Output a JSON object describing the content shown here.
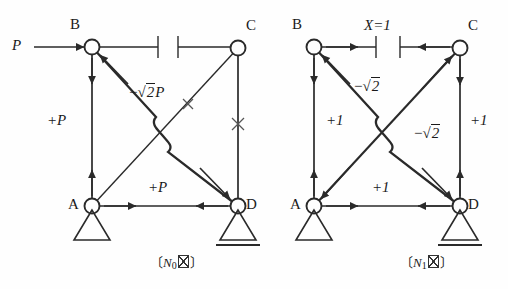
{
  "figure": {
    "type": "truss-force-diagram-pair"
  },
  "panels": [
    {
      "id": "N0",
      "caption_prefix": "〔",
      "caption_symbol": "N",
      "caption_sub": "0",
      "caption_kanji": "図",
      "caption_suffix": "〕",
      "caption_plain": "〔N0図〕",
      "nodes": [
        {
          "id": "B",
          "label": "B",
          "x": 92,
          "y": 47,
          "label_dx": -22,
          "label_dy": -30
        },
        {
          "id": "C",
          "label": "C",
          "x": 238,
          "y": 48,
          "label_dx": 8,
          "label_dy": -30
        },
        {
          "id": "A",
          "label": "A",
          "x": 92,
          "y": 206,
          "label_dx": -24,
          "label_dy": -9
        },
        {
          "id": "D",
          "label": "D",
          "x": 238,
          "y": 206,
          "label_dx": 8,
          "label_dy": -9
        }
      ],
      "external_load": {
        "label": "P",
        "applied_at": "B",
        "direction": "right"
      },
      "members": [
        {
          "name": "top-chord-BC",
          "from": "B",
          "to": "C",
          "force": "",
          "state": "cut-released"
        },
        {
          "name": "left-chord-AB",
          "from": "A",
          "to": "B",
          "force": "+P",
          "state": "tension"
        },
        {
          "name": "right-chord-CD",
          "from": "C",
          "to": "D",
          "force": "",
          "state": "zero-force"
        },
        {
          "name": "bottom-chord-AD",
          "from": "A",
          "to": "D",
          "force": "+P",
          "state": "tension"
        },
        {
          "name": "diagonal-BD",
          "from": "B",
          "to": "D",
          "force": "-√2 P",
          "state": "compression"
        },
        {
          "name": "diagonal-AC",
          "from": "A",
          "to": "C",
          "force": "",
          "state": "zero-force"
        }
      ],
      "labels": {
        "load": "P",
        "left_chord": "+P",
        "bottom_chord": "+P",
        "diagonal_minus": "P"
      },
      "supports": [
        {
          "node": "A",
          "type": "pin"
        },
        {
          "node": "D",
          "type": "roller"
        }
      ]
    },
    {
      "id": "N1",
      "caption_prefix": "〔",
      "caption_symbol": "N",
      "caption_sub": "1",
      "caption_kanji": "図",
      "caption_suffix": "〕",
      "caption_plain": "〔N1図〕",
      "nodes": [
        {
          "id": "B",
          "label": "B",
          "x": 60,
          "y": 47,
          "label_dx": -22,
          "label_dy": -30
        },
        {
          "id": "C",
          "label": "C",
          "x": 206,
          "y": 48,
          "label_dx": 8,
          "label_dy": -30
        },
        {
          "id": "A",
          "label": "A",
          "x": 60,
          "y": 206,
          "label_dx": -24,
          "label_dy": -9
        },
        {
          "id": "D",
          "label": "D",
          "x": 206,
          "y": 206,
          "label_dx": 8,
          "label_dy": -9
        }
      ],
      "external_load": {
        "label": "X=1",
        "applied_at": "top-chord-cut",
        "direction": "inward-pair"
      },
      "members": [
        {
          "name": "top-chord-BC",
          "from": "B",
          "to": "C",
          "force": "X=1",
          "state": "unit-load"
        },
        {
          "name": "left-chord-AB",
          "from": "A",
          "to": "B",
          "force": "+1",
          "state": "tension"
        },
        {
          "name": "right-chord-CD",
          "from": "C",
          "to": "D",
          "force": "+1",
          "state": "tension"
        },
        {
          "name": "bottom-chord-AD",
          "from": "A",
          "to": "D",
          "force": "+1",
          "state": "tension"
        },
        {
          "name": "diagonal-BD",
          "from": "B",
          "to": "D",
          "force": "-√2",
          "state": "compression"
        },
        {
          "name": "diagonal-AC",
          "from": "A",
          "to": "C",
          "force": "-√2",
          "state": "compression"
        }
      ],
      "labels": {
        "unit_load": "X=1",
        "left_chord": "+1",
        "right_chord": "+1",
        "bottom_chord": "+1"
      },
      "supports": [
        {
          "node": "A",
          "type": "pin"
        },
        {
          "node": "D",
          "type": "roller"
        }
      ]
    }
  ],
  "colors": {
    "line": "#2a2a2a",
    "text": "#1a1a1a",
    "background": "#fefefe"
  }
}
